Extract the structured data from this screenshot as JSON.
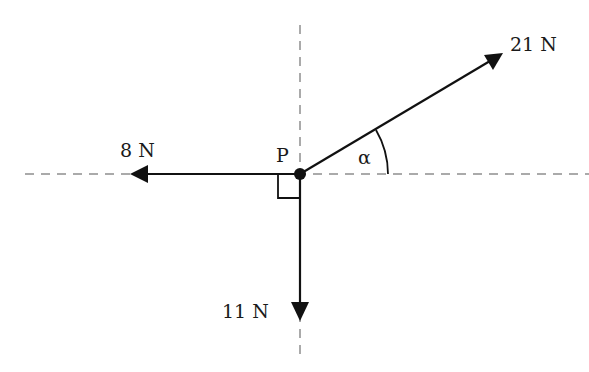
{
  "diagram": {
    "type": "force-diagram",
    "point": {
      "label": "P",
      "x": 300,
      "y": 174
    },
    "angle_label": "α",
    "right_angle_marker": true,
    "forces": [
      {
        "name": "force-21n",
        "label": "21 N",
        "direction": "up-right at angle α above horizontal",
        "tip": [
          502,
          54
        ]
      },
      {
        "name": "force-8n",
        "label": "8 N",
        "direction": "left (horizontal)",
        "tip": [
          130,
          174
        ]
      },
      {
        "name": "force-11n",
        "label": "11 N",
        "direction": "down (vertical)",
        "tip": [
          300,
          320
        ]
      }
    ],
    "axes": {
      "horizontal_dashed": {
        "x1": 25,
        "x2": 589,
        "y": 174
      },
      "vertical_dashed": {
        "x": 300,
        "y1": 25,
        "y2": 358
      }
    },
    "colors": {
      "line": "#111111",
      "dashed": "#aaaaaa",
      "background": "#ffffff"
    }
  }
}
